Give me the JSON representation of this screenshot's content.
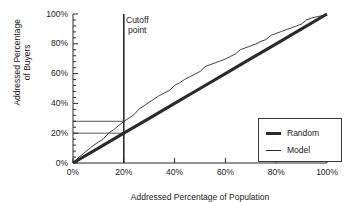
{
  "chart_data": {
    "type": "line",
    "title": "",
    "xlabel": "Addressed Percentage of Population",
    "ylabel_line1": "Addressed Percentage",
    "ylabel_line2": "of Buyers",
    "xlim": [
      0,
      100
    ],
    "ylim": [
      0,
      100
    ],
    "grid": false,
    "legend_position": "bottom-right",
    "xticks": [
      "0%",
      "20%",
      "40%",
      "60%",
      "80%",
      "100%"
    ],
    "xtick_values": [
      0,
      20,
      40,
      60,
      80,
      100
    ],
    "yticks": [
      "0%",
      "20%",
      "40%",
      "60%",
      "80%",
      "100%"
    ],
    "ytick_values": [
      0,
      20,
      40,
      60,
      80,
      100
    ],
    "minor_ticks": true,
    "series": [
      {
        "name": "Random",
        "style": "thick-straight",
        "color": "#2b2b2b",
        "x": [
          0,
          10,
          20,
          30,
          40,
          50,
          60,
          70,
          80,
          90,
          100
        ],
        "values": [
          0,
          10,
          20,
          30,
          40,
          50,
          60,
          70,
          80,
          90,
          100
        ]
      },
      {
        "name": "Model",
        "style": "thin-jagged",
        "color": "#2b2b2b",
        "x": [
          0,
          2,
          4,
          6,
          8,
          10,
          12,
          14,
          16,
          18,
          20,
          22,
          24,
          26,
          28,
          30,
          32,
          34,
          36,
          38,
          40,
          42,
          44,
          46,
          48,
          50,
          52,
          54,
          56,
          58,
          60,
          62,
          64,
          66,
          68,
          70,
          72,
          74,
          76,
          78,
          80,
          82,
          84,
          86,
          88,
          90,
          92,
          94,
          96,
          98,
          100
        ],
        "values": [
          0,
          3,
          6,
          9,
          12,
          14.5,
          17,
          19.5,
          22,
          25,
          28,
          30.5,
          33,
          35.5,
          38,
          40.5,
          43,
          45.5,
          47.5,
          49.5,
          51.5,
          53.5,
          56,
          58,
          60,
          62,
          64,
          65.5,
          67,
          68.5,
          70,
          72,
          74,
          75.5,
          77,
          78.5,
          80,
          82,
          83.5,
          85,
          86.5,
          88,
          89.5,
          91,
          92.5,
          94,
          95.5,
          97,
          98,
          99,
          100
        ]
      }
    ],
    "annotations": [
      {
        "name": "cutoff-point",
        "line1": "Cutoff",
        "line2": "point",
        "x_value": 20,
        "type": "vertical-line-with-label"
      },
      {
        "name": "model-gain-reference",
        "type": "horizontal-reference-line",
        "y_value": 28,
        "from_x": 0,
        "to_x": 20
      },
      {
        "name": "random-gain-reference",
        "type": "horizontal-reference-line",
        "y_value": 20,
        "from_x": 0,
        "to_x": 20
      }
    ]
  },
  "legend": {
    "items": [
      {
        "label": "Random"
      },
      {
        "label": "Model"
      }
    ]
  },
  "axes": {
    "x_title": "Addressed Percentage of Population",
    "y_title_line1": "Addressed Percentage",
    "y_title_line2": "of Buyers"
  },
  "annotation": {
    "cutoff_line1": "Cutoff",
    "cutoff_line2": "point"
  },
  "colors": {
    "ink": "#1a1a1a",
    "line": "#2b2b2b",
    "background": "#ffffff"
  }
}
